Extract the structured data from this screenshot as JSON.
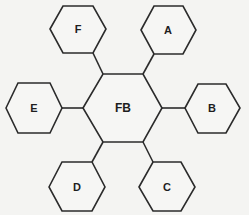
{
  "diagram": {
    "type": "hexagon-hub-and-spoke",
    "center": {
      "id": "FB",
      "label": "FB",
      "cx": 123,
      "cy": 108,
      "points": "83,108 103,74 143,74 162,108 143,142 103,142"
    },
    "nodes": [
      {
        "id": "A",
        "label": "A",
        "cx": 168,
        "cy": 30,
        "points": "141,30 154,6 183,6 196,30 183,54 154,54"
      },
      {
        "id": "B",
        "label": "B",
        "cx": 212,
        "cy": 108,
        "points": "185,108 198,84 226,84 240,108 226,133 198,133"
      },
      {
        "id": "C",
        "label": "C",
        "cx": 167,
        "cy": 187,
        "points": "139,187 153,162 181,162 195,187 181,211 153,211"
      },
      {
        "id": "D",
        "label": "D",
        "cx": 77,
        "cy": 187,
        "points": "49,187 62,162 92,162 105,187 92,211 62,211"
      },
      {
        "id": "E",
        "label": "E",
        "cx": 34,
        "cy": 108,
        "points": "6,108 18,83 50,83 62,108 50,133 18,133"
      },
      {
        "id": "F",
        "label": "F",
        "cx": 78,
        "cy": 29,
        "points": "50,29 63,6 93,6 106,29 93,53 63,53"
      }
    ],
    "edges": [
      {
        "from": "FB",
        "to": "A",
        "points": "143,74 154,54"
      },
      {
        "from": "FB",
        "to": "B",
        "points": "162,108 185,108"
      },
      {
        "from": "FB",
        "to": "C",
        "points": "143,142 153,162"
      },
      {
        "from": "FB",
        "to": "D",
        "points": "103,142 92,162"
      },
      {
        "from": "FB",
        "to": "E",
        "points": "83,108 62,108"
      },
      {
        "from": "FB",
        "to": "F",
        "points": "103,74 93,53"
      }
    ]
  }
}
